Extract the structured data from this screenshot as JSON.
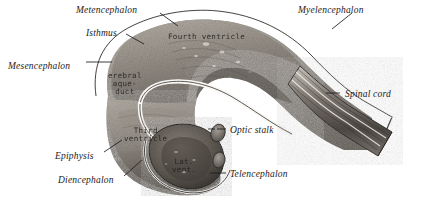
{
  "figure": {
    "kind": "anatomical-engraving",
    "style": "grayscale stipple/line engraving",
    "background_color": "#ffffff",
    "ink_color": "#1b1b1b"
  },
  "external_labels": [
    {
      "id": "metencephalon",
      "text": "Metencephalon",
      "x": 76,
      "y": 6,
      "leader": true
    },
    {
      "id": "myelencephalon",
      "text": "Myelencephalon",
      "x": 298,
      "y": 6,
      "leader": true
    },
    {
      "id": "isthmus",
      "text": "Isthmus",
      "x": 86,
      "y": 29,
      "leader": true
    },
    {
      "id": "mesencephalon",
      "text": "Mesencephalon",
      "x": 8,
      "y": 62,
      "leader": true
    },
    {
      "id": "spinal-cord",
      "text": "Spinal cord",
      "x": 345,
      "y": 90,
      "leader": true
    },
    {
      "id": "optic-stalk",
      "text": "Optic stalk",
      "x": 230,
      "y": 126,
      "leader": true
    },
    {
      "id": "epiphysis",
      "text": "Epiphysis",
      "x": 55,
      "y": 152,
      "leader": true
    },
    {
      "id": "telencephalon",
      "text": "Telencephalon",
      "x": 230,
      "y": 170,
      "leader": true
    },
    {
      "id": "diencephalon",
      "text": "Diencephalon",
      "x": 58,
      "y": 176,
      "leader": true
    }
  ],
  "internal_labels": [
    {
      "id": "fourth-ventricle",
      "lines": [
        "Fourth ventricle"
      ],
      "x": 168,
      "y": 33
    },
    {
      "id": "cerebral-aqueduct",
      "lines": [
        "erebral",
        "aque-",
        "duct"
      ],
      "x": 108,
      "y": 72
    },
    {
      "id": "third-ventricle",
      "lines": [
        "Third",
        "ventricle"
      ],
      "x": 124,
      "y": 127
    },
    {
      "id": "lateral-ventricle",
      "lines": [
        "Lat.",
        "vent."
      ],
      "x": 172,
      "y": 158
    }
  ],
  "colors": {
    "ink": "#1b1b1b",
    "specimen_light": "#cfcac2",
    "specimen_mid": "#9a948c",
    "specimen_dark": "#615c56",
    "specimen_deep": "#3e3a36",
    "outline": "#2a2724",
    "paper": "#ffffff"
  }
}
